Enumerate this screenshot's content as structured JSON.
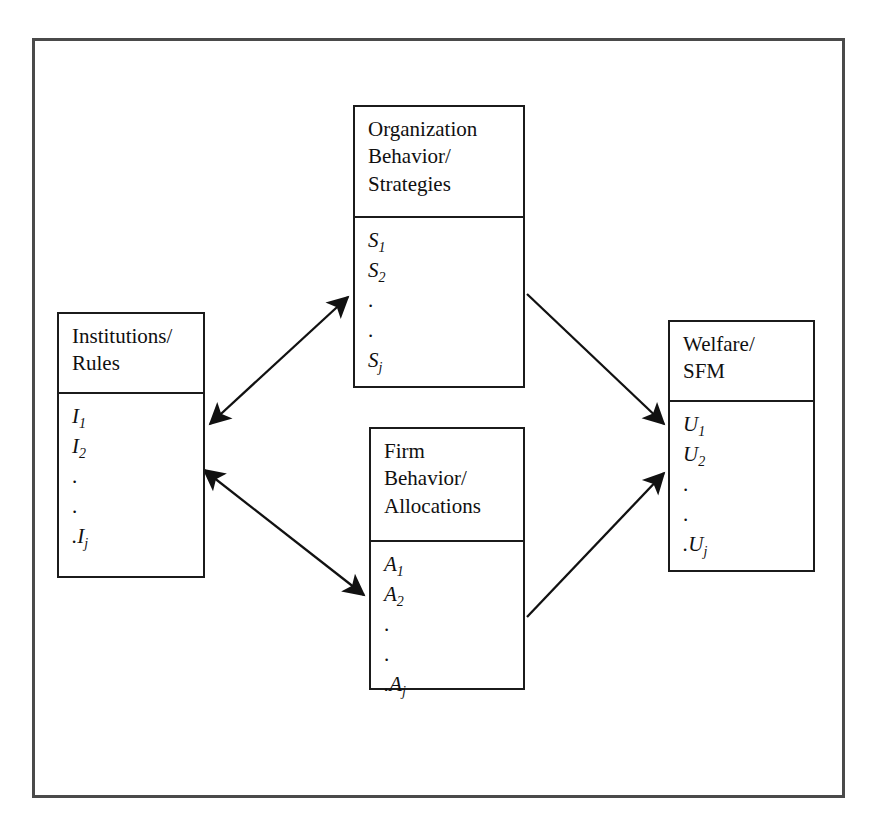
{
  "diagram": {
    "frame_color": "#4a4a4a",
    "box_border_color": "#1b1b1b",
    "text_color": "#101010",
    "nodes": [
      {
        "id": "institutions",
        "header_lines": [
          "Institutions/",
          "Rules"
        ],
        "items": [
          {
            "base": "I",
            "sub": "1"
          },
          {
            "base": "I",
            "sub": "2"
          },
          {
            "base": ".",
            "sub": ""
          },
          {
            "base": ".",
            "sub": ""
          },
          {
            "base": ".I",
            "sub": "j"
          }
        ]
      },
      {
        "id": "organization",
        "header_lines": [
          "Organization",
          "Behavior/",
          "Strategies"
        ],
        "items": [
          {
            "base": "S",
            "sub": "1"
          },
          {
            "base": "S",
            "sub": "2"
          },
          {
            "base": ".",
            "sub": ""
          },
          {
            "base": ".",
            "sub": ""
          },
          {
            "base": "S",
            "sub": "j"
          }
        ]
      },
      {
        "id": "firm",
        "header_lines": [
          "Firm",
          "Behavior/",
          "Allocations"
        ],
        "items": [
          {
            "base": "A",
            "sub": "1"
          },
          {
            "base": "A",
            "sub": "2"
          },
          {
            "base": ".",
            "sub": ""
          },
          {
            "base": ".",
            "sub": ""
          },
          {
            "base": ".A",
            "sub": "j"
          }
        ]
      },
      {
        "id": "welfare",
        "header_lines": [
          "Welfare/",
          "SFM"
        ],
        "items": [
          {
            "base": "U",
            "sub": "1"
          },
          {
            "base": "U",
            "sub": "2"
          },
          {
            "base": ".",
            "sub": ""
          },
          {
            "base": ".",
            "sub": ""
          },
          {
            "base": ".U",
            "sub": "j"
          }
        ]
      }
    ],
    "connections": [
      {
        "id": "institutions-organization",
        "from": "institutions",
        "to": "organization",
        "style": "double-headed"
      },
      {
        "id": "institutions-firm",
        "from": "institutions",
        "to": "firm",
        "style": "double-headed"
      },
      {
        "id": "organization-welfare",
        "from": "organization",
        "to": "welfare",
        "style": "single-headed"
      },
      {
        "id": "firm-welfare",
        "from": "firm",
        "to": "welfare",
        "style": "single-headed"
      }
    ]
  }
}
